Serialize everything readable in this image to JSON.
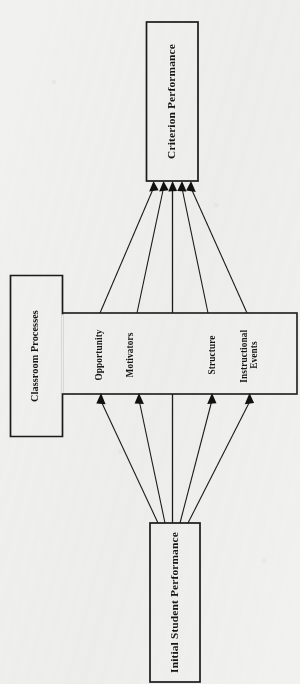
{
  "diagram": {
    "orientation": "rotated-90",
    "background_color": "#f1f1ef",
    "line_color": "#1b1b1b",
    "boxes": {
      "criterion": {
        "label": "Criterion Performance"
      },
      "classroom": {
        "label": "Classroom Processes"
      },
      "initial": {
        "label": "Initial Student Performance"
      }
    },
    "band_items": [
      {
        "label": "Opportunity"
      },
      {
        "label": "Motivators"
      },
      {
        "label": "Structure"
      },
      {
        "label": "Instructional Events"
      }
    ],
    "connections": {
      "to_criterion_count": 5,
      "to_band_count": 4,
      "center_line": "Initial Student Performance to Criterion Performance"
    }
  }
}
